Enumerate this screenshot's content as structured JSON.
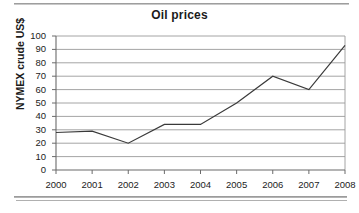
{
  "document": {
    "divider_top": "horizontal-rule",
    "divider_bottom": "horizontal-rule"
  },
  "chart_data": {
    "type": "line",
    "title": "Oil prices",
    "xlabel": "",
    "ylabel": "NYMEX crude US$",
    "categories": [
      "2000",
      "2001",
      "2002",
      "2003",
      "2004",
      "2005",
      "2006",
      "2007",
      "2008"
    ],
    "values": [
      28,
      29,
      20,
      34,
      34,
      50,
      70,
      60,
      93
    ],
    "series": [
      {
        "name": "NYMEX crude US$",
        "values": [
          28,
          29,
          20,
          34,
          34,
          50,
          70,
          60,
          93
        ]
      }
    ],
    "ylim": [
      0,
      100
    ],
    "yticks": [
      0,
      10,
      20,
      30,
      40,
      50,
      60,
      70,
      80,
      90,
      100
    ],
    "ytick_labels": [
      "0",
      "10",
      "20",
      "30",
      "40",
      "50",
      "60",
      "70",
      "80",
      "90",
      "100"
    ],
    "grid": "horizontal",
    "legend": "none",
    "line_color": "#3a3a3a",
    "grid_color": "#9a9a9a",
    "axis_color": "#6b6b6b",
    "background": "#ffffff"
  }
}
